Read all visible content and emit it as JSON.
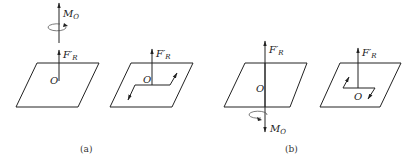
{
  "figure": {
    "panels": [
      {
        "caption": "(a)",
        "moment_label": "M",
        "moment_sub": "O",
        "moment_direction": "up",
        "force_label": "F′",
        "force_sub": "R",
        "origin_label": "O"
      },
      {
        "caption": "(b)",
        "moment_label": "M",
        "moment_sub": "O",
        "moment_direction": "down",
        "force_label": "F′",
        "force_sub": "R",
        "origin_label": "O"
      }
    ],
    "equivalent_planes": [
      {
        "force_label": "F′",
        "force_sub": "R",
        "origin_label": "O",
        "couple": "counterclockwise"
      },
      {
        "force_label": "F′",
        "force_sub": "R",
        "origin_label": "O",
        "couple": "clockwise"
      }
    ]
  }
}
